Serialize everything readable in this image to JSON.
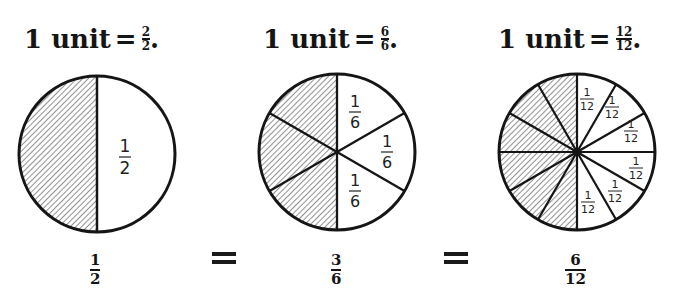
{
  "headings": [
    {
      "prefix": "1 unit",
      "equals": "=",
      "numerator": "2",
      "denominator": "2",
      "suffix": "."
    },
    {
      "prefix": "1 unit",
      "equals": "=",
      "numerator": "6",
      "denominator": "6",
      "suffix": "."
    },
    {
      "prefix": "1 unit",
      "equals": "=",
      "numerator": "12",
      "denominator": "12",
      "suffix": "."
    }
  ],
  "circles": [
    {
      "divisions": 2,
      "shaded_count": 1,
      "label": {
        "numerator": "1",
        "denominator": "2"
      }
    },
    {
      "divisions": 6,
      "shaded_count": 3,
      "label": {
        "numerator": "1",
        "denominator": "6"
      }
    },
    {
      "divisions": 12,
      "shaded_count": 6,
      "label": {
        "numerator": "1",
        "denominator": "12"
      }
    }
  ],
  "equation": {
    "terms": [
      {
        "numerator": "1",
        "denominator": "2"
      },
      {
        "numerator": "3",
        "denominator": "6"
      },
      {
        "numerator": "6",
        "denominator": "12"
      }
    ],
    "operator": "="
  },
  "colors": {
    "ink": "#151515",
    "paper": "#ffffff",
    "hatch": "#444444"
  }
}
